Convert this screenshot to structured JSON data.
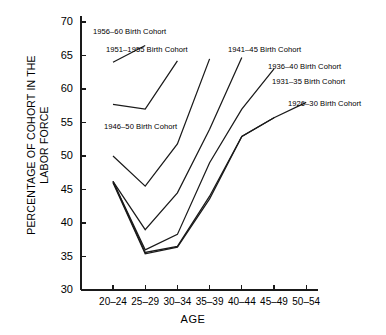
{
  "chart_data": {
    "type": "line",
    "title": "",
    "xlabel": "AGE",
    "ylabel": "PERCENTAGE OF COHORT IN THE\nLABOR FORCE",
    "categories": [
      "20–24",
      "25–29",
      "30–34",
      "35–39",
      "40–44",
      "45–49",
      "50–54"
    ],
    "ylim": [
      30,
      70
    ],
    "yticks": [
      30,
      35,
      40,
      45,
      50,
      55,
      60,
      65,
      70
    ],
    "grid": false,
    "legend_position": "inline-annotations",
    "line_color": "#1a1a1a",
    "series": [
      {
        "name": "1956–60 Birth Cohort",
        "x": [
          "20–24",
          "25–29"
        ],
        "values": [
          64.0,
          66.5
        ]
      },
      {
        "name": "1951–1955 Birth Cohort",
        "x": [
          "20–24",
          "25–29",
          "30–34"
        ],
        "values": [
          57.7,
          57.0,
          64.2
        ]
      },
      {
        "name": "1946–50 Birth Cohort",
        "x": [
          "20–24",
          "25–29",
          "30–34",
          "35–39"
        ],
        "values": [
          50.0,
          45.5,
          51.8,
          64.5
        ]
      },
      {
        "name": "1941–45 Birth Cohort",
        "x": [
          "20–24",
          "25–29",
          "30–34",
          "35–39",
          "40–44"
        ],
        "values": [
          46.2,
          39.0,
          44.5,
          54.0,
          64.7
        ]
      },
      {
        "name": "1936–40 Birth Cohort",
        "x": [
          "20–24",
          "25–29",
          "30–34",
          "35–39",
          "40–44",
          "45–49"
        ],
        "values": [
          46.2,
          36.0,
          38.3,
          49.0,
          57.0,
          63.0
        ]
      },
      {
        "name": "1931–35 Birth Cohort",
        "x": [
          "20–24",
          "25–29",
          "30–34",
          "35–39",
          "40–44",
          "45–49"
        ],
        "values": [
          46.2,
          35.6,
          36.5,
          44.0,
          52.9,
          55.7
        ]
      },
      {
        "name": "1926–30 Birth Cohort",
        "x": [
          "20–24",
          "25–29",
          "30–34",
          "35–39",
          "40–44",
          "45–49",
          "50–54"
        ],
        "values": [
          46.0,
          35.4,
          36.4,
          43.6,
          52.9,
          55.7,
          58.0
        ]
      }
    ],
    "annotations": [
      {
        "text": "1956–60 Birth Cohort",
        "x": 93,
        "y": 27
      },
      {
        "text": "1951–1955 Birth Cohort",
        "x": 106,
        "y": 45
      },
      {
        "text": "1941–45 Birth Cohort",
        "x": 228,
        "y": 45
      },
      {
        "text": "1936–40 Birth Cohort",
        "x": 268,
        "y": 62
      },
      {
        "text": "1931–35 Birth Cohort",
        "x": 272,
        "y": 77
      },
      {
        "text": "1926–30 Birth Cohort",
        "x": 288,
        "y": 99
      },
      {
        "text": "1946–50 Birth Cohort",
        "x": 104,
        "y": 122
      }
    ]
  },
  "axis": {
    "y_title_line1": "PERCENTAGE OF COHORT IN THE",
    "y_title_line2": "LABOR FORCE",
    "x_title": "AGE",
    "y_labels": [
      "70",
      "65",
      "60",
      "55",
      "50",
      "45",
      "40",
      "35",
      "30"
    ],
    "x_labels": [
      "20–24",
      "25–29",
      "30–34",
      "35–39",
      "40–44",
      "45–49",
      "50–54"
    ]
  }
}
